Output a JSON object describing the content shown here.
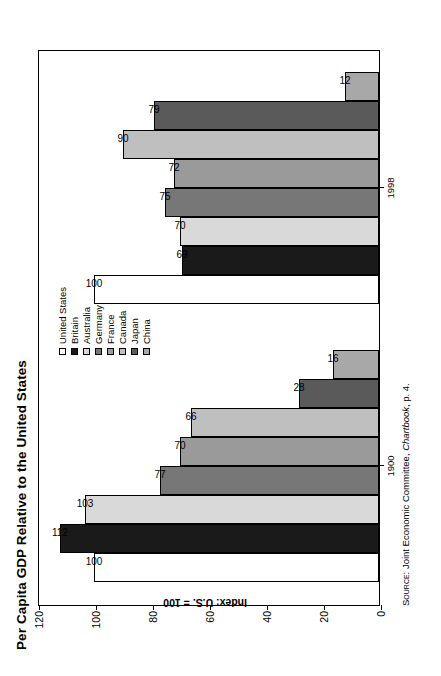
{
  "title": "Per Capita GDP Relative to the United States",
  "source": {
    "prefix": "Source:",
    "text": " Joint Economic Committee, ",
    "italic": "Chartbook",
    "suffix": ", p. 4."
  },
  "axis": {
    "ylabel": "Index: U.S. = 100",
    "yticks": [
      "120",
      "100",
      "80",
      "60",
      "40",
      "20",
      "0"
    ],
    "ymin": 0,
    "ymax": 120,
    "xgroups": [
      "1900",
      "1998"
    ]
  },
  "legend": {
    "items": [
      {
        "label": "United States",
        "color": "#ffffff"
      },
      {
        "label": "Britain",
        "color": "#1a1a1a"
      },
      {
        "label": "Australia",
        "color": "#d9d9d9"
      },
      {
        "label": "Germany",
        "color": "#777777"
      },
      {
        "label": "France",
        "color": "#9a9a9a"
      },
      {
        "label": "Canada",
        "color": "#bfbfbf"
      },
      {
        "label": "Japan",
        "color": "#5a5a5a"
      },
      {
        "label": "China",
        "color": "#a8a8a8"
      }
    ]
  },
  "chart_data": {
    "type": "bar",
    "title": "Per Capita GDP Relative to the United States",
    "xlabel": "",
    "ylabel": "Index: U.S. = 100",
    "ylim": [
      0,
      120
    ],
    "grid": false,
    "legend_position": "top-center",
    "categories": [
      "1900",
      "1998"
    ],
    "series": [
      {
        "name": "United States",
        "color": "#ffffff",
        "values": [
          100,
          100
        ]
      },
      {
        "name": "Britain",
        "color": "#1a1a1a",
        "values": [
          112,
          69
        ]
      },
      {
        "name": "Australia",
        "color": "#d9d9d9",
        "values": [
          103,
          70
        ]
      },
      {
        "name": "Germany",
        "color": "#777777",
        "values": [
          77,
          75
        ]
      },
      {
        "name": "France",
        "color": "#9a9a9a",
        "values": [
          70,
          72
        ]
      },
      {
        "name": "Canada",
        "color": "#bfbfbf",
        "values": [
          66,
          90
        ]
      },
      {
        "name": "Japan",
        "color": "#5a5a5a",
        "values": [
          28,
          79
        ]
      },
      {
        "name": "China",
        "color": "#a8a8a8",
        "values": [
          16,
          12
        ]
      }
    ],
    "data_labels": [
      [
        "100",
        "112",
        "103",
        "77",
        "70",
        "66",
        "28",
        "16"
      ],
      [
        "100",
        "69",
        "70",
        "75",
        "72",
        "90",
        "79",
        "12"
      ]
    ]
  }
}
